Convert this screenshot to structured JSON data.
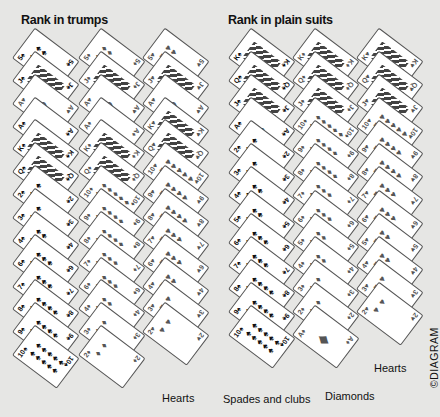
{
  "headings": {
    "trumps": "Rank in trumps",
    "plain": "Rank in plain suits"
  },
  "labels": {
    "trump_hearts": "Hearts",
    "plain_spades_clubs": "Spades and clubs",
    "plain_diamonds": "Diamonds",
    "plain_hearts": "Hearts"
  },
  "copyright": "©DIAGRAM",
  "colors": {
    "background": "#e6e6e4",
    "card": "#ffffff",
    "black_suit": "#111111",
    "red_suit": "#555555"
  },
  "columns": [
    {
      "id": "trump-black",
      "group": "trumps",
      "suit": "spade",
      "ranks": [
        "5",
        "J",
        "A♥",
        "A",
        "K",
        "Q",
        "2",
        "3",
        "4",
        "6",
        "7",
        "8",
        "9",
        "10"
      ]
    },
    {
      "id": "trump-diamonds",
      "group": "trumps",
      "suit": "diamond",
      "ranks": [
        "5",
        "J",
        "A♥",
        "A",
        "K",
        "Q",
        "10",
        "9",
        "8",
        "7",
        "6",
        "4",
        "3",
        "2"
      ]
    },
    {
      "id": "trump-hearts",
      "group": "trumps",
      "suit": "heart",
      "ranks": [
        "5",
        "J",
        "A",
        "K",
        "Q",
        "10",
        "9",
        "8",
        "7",
        "6",
        "4",
        "3",
        "2"
      ]
    },
    {
      "id": "plain-black",
      "group": "plain",
      "suit": "spade",
      "ranks": [
        "K",
        "Q",
        "J",
        "A",
        "2",
        "3",
        "4",
        "5",
        "6",
        "7",
        "8",
        "9",
        "10"
      ]
    },
    {
      "id": "plain-diamonds",
      "group": "plain",
      "suit": "diamond",
      "ranks": [
        "K",
        "Q",
        "J",
        "10",
        "9",
        "8",
        "7",
        "6",
        "5",
        "4",
        "3",
        "2",
        "A"
      ]
    },
    {
      "id": "plain-hearts",
      "group": "plain",
      "suit": "heart",
      "ranks": [
        "K",
        "Q",
        "J",
        "10",
        "9",
        "8",
        "7",
        "6",
        "5",
        "4",
        "3",
        "2"
      ]
    }
  ]
}
